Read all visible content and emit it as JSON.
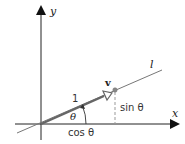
{
  "diagram": {
    "axes": {
      "x_label": "x",
      "y_label": "y"
    },
    "line_label": "l",
    "vector_label": "v",
    "unit_length_label": "1",
    "angle_label": "θ",
    "sin_label": "sin θ",
    "cos_label": "cos θ",
    "colors": {
      "axis": "#111111",
      "line": "#777777",
      "vector": "#666666",
      "point": "#888888",
      "dashed": "#999999"
    }
  }
}
